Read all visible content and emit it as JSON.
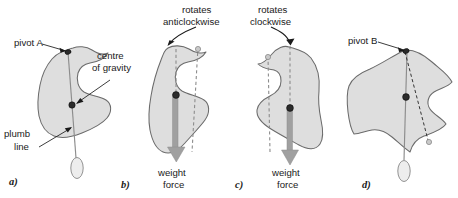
{
  "figure": {
    "panels": [
      {
        "id": "a",
        "letter": "a)",
        "labels": [
          {
            "name": "pivot-a",
            "text": "pivot A"
          },
          {
            "name": "centre-of-gravity",
            "line1": "centre",
            "line2": "of gravity"
          },
          {
            "name": "plumb-line",
            "line1": "plumb",
            "line2": "line"
          }
        ],
        "markers": {
          "pivot": "pivot-point",
          "cog": "centre-of-gravity-dot",
          "bob": "plumb-bob"
        }
      },
      {
        "id": "b",
        "letter": "b)",
        "labels": [
          {
            "name": "rotation-direction",
            "line1": "rotates",
            "line2": "anticlockwise"
          },
          {
            "name": "weight-force",
            "line1": "weight",
            "line2": "force"
          }
        ],
        "markers": {
          "pivot": "pivot-point",
          "cog": "centre-of-gravity-dot",
          "ghost": "previous-pivot-marker"
        }
      },
      {
        "id": "c",
        "letter": "c)",
        "labels": [
          {
            "name": "rotation-direction",
            "line1": "rotates",
            "line2": "clockwise"
          },
          {
            "name": "weight-force",
            "line1": "weight",
            "line2": "force"
          }
        ],
        "markers": {
          "pivot": "pivot-point",
          "cog": "centre-of-gravity-dot",
          "ghost": "previous-pivot-marker"
        }
      },
      {
        "id": "d",
        "letter": "d)",
        "labels": [
          {
            "name": "pivot-b",
            "text": "pivot B"
          }
        ],
        "markers": {
          "pivot": "pivot-point",
          "cog": "centre-of-gravity-dot",
          "bob": "plumb-bob",
          "ghost": "previous-plumb-line-end"
        }
      }
    ],
    "colors": {
      "blob_fill": "#dedede",
      "blob_stroke": "#6b6b6b",
      "text": "#1a1a1a",
      "plumb_line": "#8c8c8c",
      "weight_arrow": "#a0a0a0",
      "cog_dot": "#2b2b2b",
      "background": "#ffffff"
    }
  }
}
